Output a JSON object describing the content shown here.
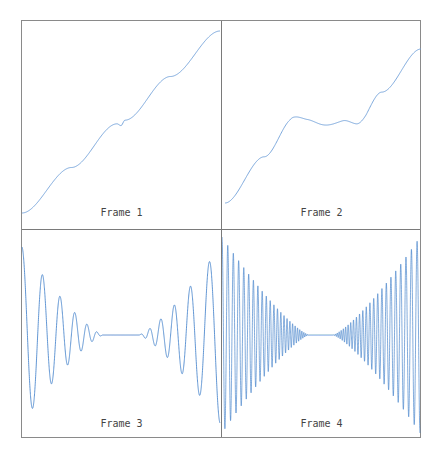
{
  "chart_data": [
    {
      "type": "line",
      "title": "Frame 1",
      "description": "Nearly straight increasing line with a small kink at the center",
      "x": [
        0,
        0.25,
        0.48,
        0.5,
        0.52,
        0.75,
        1.0
      ],
      "y": [
        0.0,
        0.25,
        0.49,
        0.48,
        0.51,
        0.75,
        1.0
      ],
      "grid": false,
      "axes_visible": false,
      "line_color": "#6f9fd8"
    },
    {
      "type": "line",
      "title": "Frame 2",
      "description": "Increasing line with a flat plateau with small wiggles in the middle",
      "x": [
        0,
        0.2,
        0.35,
        0.42,
        0.5,
        0.6,
        0.67,
        0.8,
        1.0
      ],
      "y": [
        0.0,
        0.3,
        0.55,
        0.53,
        0.52,
        0.53,
        0.5,
        0.72,
        1.0
      ],
      "grid": false,
      "axes_visible": false,
      "line_color": "#6f9fd8"
    },
    {
      "type": "line",
      "title": "Frame 3",
      "description": "Symmetric chirp: large low-frequency oscillations at edges shrinking to flat line at center",
      "cycles_per_half": 8,
      "amplitude_edge": 1.0,
      "grid": false,
      "axes_visible": false,
      "line_color": "#3a7bc8"
    },
    {
      "type": "line",
      "title": "Frame 4",
      "description": "Symmetric chirp with higher frequency: dense oscillation envelope converging to center",
      "cycles_per_half": 30,
      "amplitude_edge": 1.0,
      "grid": false,
      "axes_visible": false,
      "line_color": "#2f73c4"
    }
  ],
  "panels": [
    {
      "label": "Frame 1"
    },
    {
      "label": "Frame 2"
    },
    {
      "label": "Frame 3"
    },
    {
      "label": "Frame 4"
    }
  ],
  "colors": {
    "line": "#6f9fd8",
    "line_dense": "#2f73c4",
    "border": "#8a8a8a",
    "label": "#444444"
  }
}
